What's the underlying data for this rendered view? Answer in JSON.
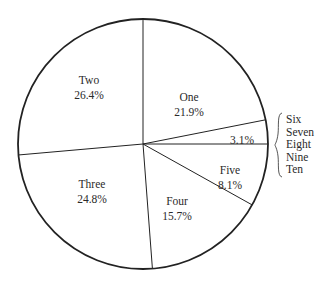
{
  "chart_data": {
    "type": "pie",
    "title": "",
    "start_angle_deg": -90,
    "direction": "clockwise",
    "slices": [
      {
        "label": "One",
        "value": 21.9,
        "display": "21.9%"
      },
      {
        "label": "Six–Ten",
        "value": 3.1,
        "display": "3.1%",
        "grouped_labels": [
          "Six",
          "Seven",
          "Eight",
          "Nine",
          "Ten"
        ]
      },
      {
        "label": "Five",
        "value": 8.1,
        "display": "8.1%"
      },
      {
        "label": "Four",
        "value": 15.7,
        "display": "15.7%"
      },
      {
        "label": "Three",
        "value": 24.8,
        "display": "24.8%"
      },
      {
        "label": "Two",
        "value": 26.4,
        "display": "26.4%"
      }
    ],
    "fill_color": "#ffffff",
    "stroke_color": "#222222",
    "legend": "none; labels placed inside slices, grouped slice labelled with brace at right"
  },
  "labels": {
    "one": {
      "name": "One",
      "pct": "21.9%"
    },
    "two": {
      "name": "Two",
      "pct": "26.4%"
    },
    "three": {
      "name": "Three",
      "pct": "24.8%"
    },
    "four": {
      "name": "Four",
      "pct": "15.7%"
    },
    "five": {
      "name": "Five",
      "pct": "8.1%"
    },
    "small": {
      "pct": "3.1%"
    },
    "group": [
      "Six",
      "Seven",
      "Eight",
      "Nine",
      "Ten"
    ]
  }
}
